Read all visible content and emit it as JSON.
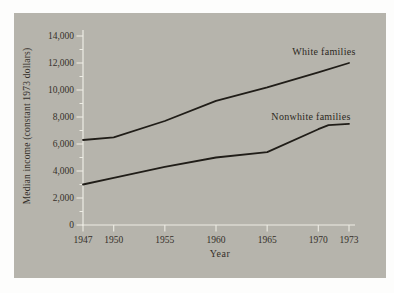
{
  "colors": {
    "page": "#fdfdfc",
    "panel": "#b6b4ac",
    "axis": "#edece4",
    "line": "#201d18",
    "text": "#35302a"
  },
  "chart_data": {
    "type": "line",
    "title": "",
    "xlabel": "Year",
    "ylabel": "Median income (constant 1973 dollars)",
    "xlim": [
      1947,
      1973
    ],
    "ylim": [
      0,
      14000
    ],
    "grid": false,
    "legend_position": "inline-labels-next-to-lines",
    "x_ticks": [
      1947,
      1950,
      1955,
      1960,
      1965,
      1970,
      1973
    ],
    "x_tick_labels": [
      "1947",
      "1950",
      "1955",
      "1960",
      "1965",
      "1970",
      "1973"
    ],
    "y_ticks": [
      0,
      2000,
      4000,
      6000,
      8000,
      10000,
      12000,
      14000
    ],
    "y_tick_labels": [
      "0",
      "2,000",
      "4,000",
      "6,000",
      "8,000",
      "10,000",
      "12,000",
      "14,000"
    ],
    "y_minor_ticks": [
      1000,
      3000,
      5000,
      7000,
      9000,
      11000,
      13000
    ],
    "series": [
      {
        "name": "White families",
        "x": [
          1947,
          1950,
          1955,
          1960,
          1965,
          1970,
          1973
        ],
        "values": [
          6300,
          6500,
          7700,
          9200,
          10200,
          11300,
          12000
        ]
      },
      {
        "name": "Nonwhite families",
        "x": [
          1947,
          1950,
          1955,
          1960,
          1965,
          1970,
          1971,
          1973
        ],
        "values": [
          3000,
          3500,
          4300,
          5000,
          5400,
          7100,
          7400,
          7500
        ]
      }
    ]
  }
}
